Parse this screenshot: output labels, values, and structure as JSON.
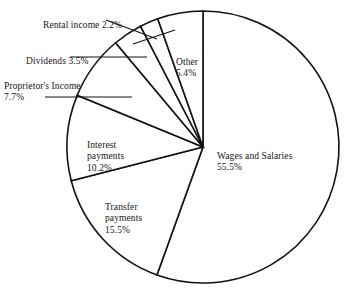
{
  "chart_data": {
    "type": "pie",
    "title": "",
    "categories": [
      "Wages and Salaries",
      "Transfer payments",
      "Interest payments",
      "Proprietor's Income",
      "Dividends",
      "Rental income",
      "Other"
    ],
    "values": [
      55.5,
      15.5,
      10.2,
      7.7,
      3.5,
      2.2,
      5.4
    ],
    "unit": "%",
    "legend_position": "none",
    "grid": false,
    "start_angle_deg": 0,
    "direction": "clockwise",
    "fill": "#ffffff",
    "stroke": "#121212",
    "slices": [
      {
        "name": "Wages and Salaries",
        "value": 55.5,
        "label": "Wages and Salaries",
        "percent": "55.5%",
        "start_deg": 0.0,
        "end_deg": 199.8
      },
      {
        "name": "Transfer payments",
        "value": 15.5,
        "label": "Transfer payments",
        "percent": "15.5%",
        "start_deg": 199.8,
        "end_deg": 255.6
      },
      {
        "name": "Interest payments",
        "value": 10.2,
        "label": "Interest payments",
        "percent": "10.2%",
        "start_deg": 255.6,
        "end_deg": 292.3
      },
      {
        "name": "Proprietor's Income",
        "value": 7.7,
        "label": "Proprietor's Income",
        "percent": "7.7%",
        "start_deg": 292.3,
        "end_deg": 320.0
      },
      {
        "name": "Dividends",
        "value": 3.5,
        "label": "Dividends",
        "percent": "3.5%",
        "start_deg": 320.0,
        "end_deg": 332.6
      },
      {
        "name": "Rental income",
        "value": 2.2,
        "label": "Rental income",
        "percent": "2.2%",
        "start_deg": 332.6,
        "end_deg": 340.5
      },
      {
        "name": "Other",
        "value": 5.4,
        "label": "Other",
        "percent": "5.4%",
        "start_deg": 340.5,
        "end_deg": 360.0
      }
    ]
  },
  "labels": {
    "rental": {
      "text": "Rental income  2.2%"
    },
    "dividends": {
      "text": "Dividends  3.5%"
    },
    "proprietor": {
      "name": "Proprietor's Income",
      "percent": "7.7%"
    },
    "interest": {
      "name": "Interest\npayments",
      "percent": "10.2%"
    },
    "transfer": {
      "name": "Transfer\npayments",
      "percent": "15.5%"
    },
    "wages": {
      "name": "Wages and Salaries",
      "percent": "55.5%"
    },
    "other": {
      "name": "Other",
      "percent": "5.4%"
    }
  }
}
